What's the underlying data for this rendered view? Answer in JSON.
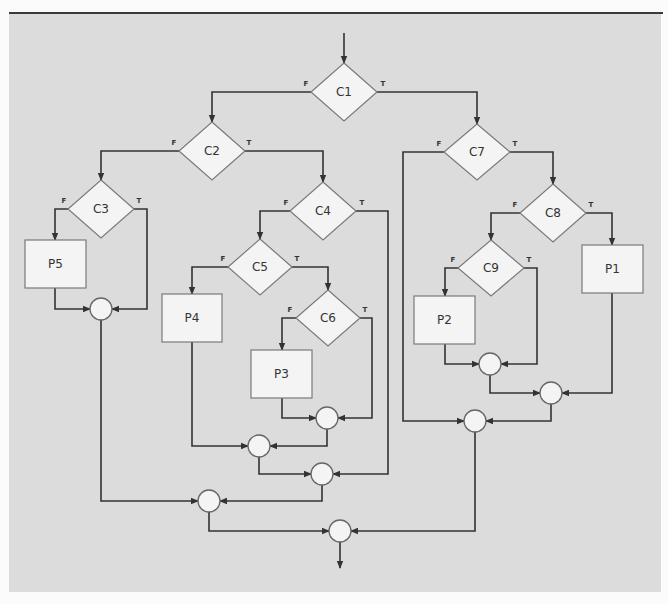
{
  "diagram": {
    "title": "",
    "type": "flowchart",
    "colors": {
      "background": "#dcdcdc",
      "node_fill": "#f4f4f4",
      "node_stroke": "#7a7a7a",
      "edge": "#333333"
    },
    "decisions": [
      {
        "id": "C1",
        "label": "C1",
        "cx": 344,
        "cy": 92,
        "hw": 33,
        "hh": 29
      },
      {
        "id": "C2",
        "label": "C2",
        "cx": 212,
        "cy": 151,
        "hw": 33,
        "hh": 29
      },
      {
        "id": "C3",
        "label": "C3",
        "cx": 101,
        "cy": 209,
        "hw": 33,
        "hh": 29
      },
      {
        "id": "C4",
        "label": "C4",
        "cx": 323,
        "cy": 211,
        "hw": 33,
        "hh": 29
      },
      {
        "id": "C5",
        "label": "C5",
        "cx": 260,
        "cy": 267,
        "hw": 32,
        "hh": 28
      },
      {
        "id": "C6",
        "label": "C6",
        "cx": 328,
        "cy": 318,
        "hw": 32,
        "hh": 28
      },
      {
        "id": "C7",
        "label": "C7",
        "cx": 477,
        "cy": 152,
        "hw": 33,
        "hh": 28
      },
      {
        "id": "C8",
        "label": "C8",
        "cx": 553,
        "cy": 213,
        "hw": 33,
        "hh": 29
      },
      {
        "id": "C9",
        "label": "C9",
        "cx": 491,
        "cy": 268,
        "hw": 33,
        "hh": 28
      }
    ],
    "processes": [
      {
        "id": "P1",
        "label": "P1",
        "x": 582,
        "y": 245,
        "w": 61,
        "h": 48
      },
      {
        "id": "P2",
        "label": "P2",
        "x": 414,
        "y": 296,
        "w": 61,
        "h": 48
      },
      {
        "id": "P3",
        "label": "P3",
        "x": 251,
        "y": 350,
        "w": 61,
        "h": 48
      },
      {
        "id": "P4",
        "label": "P4",
        "x": 162,
        "y": 294,
        "w": 60,
        "h": 48
      },
      {
        "id": "P5",
        "label": "P5",
        "x": 25,
        "y": 240,
        "w": 61,
        "h": 48
      }
    ],
    "junctions": [
      {
        "id": "J1",
        "cx": 101,
        "cy": 309,
        "r": 11
      },
      {
        "id": "J2",
        "cx": 327,
        "cy": 418,
        "r": 11
      },
      {
        "id": "J3",
        "cx": 259,
        "cy": 446,
        "r": 11
      },
      {
        "id": "J4",
        "cx": 322,
        "cy": 474,
        "r": 11
      },
      {
        "id": "J5",
        "cx": 209,
        "cy": 501,
        "r": 11
      },
      {
        "id": "J6",
        "cx": 490,
        "cy": 364,
        "r": 11
      },
      {
        "id": "J7",
        "cx": 551,
        "cy": 393,
        "r": 11
      },
      {
        "id": "J8",
        "cx": 475,
        "cy": 421,
        "r": 11
      },
      {
        "id": "J9",
        "cx": 340,
        "cy": 531,
        "r": 11
      }
    ],
    "branch_labels": [
      {
        "text": "F",
        "x": 306,
        "y": 86
      },
      {
        "text": "T",
        "x": 383,
        "y": 86
      },
      {
        "text": "F",
        "x": 174,
        "y": 145
      },
      {
        "text": "T",
        "x": 249,
        "y": 145
      },
      {
        "text": "F",
        "x": 64,
        "y": 203
      },
      {
        "text": "T",
        "x": 139,
        "y": 203
      },
      {
        "text": "F",
        "x": 286,
        "y": 205
      },
      {
        "text": "T",
        "x": 362,
        "y": 205
      },
      {
        "text": "F",
        "x": 223,
        "y": 261
      },
      {
        "text": "T",
        "x": 297,
        "y": 261
      },
      {
        "text": "F",
        "x": 290,
        "y": 312
      },
      {
        "text": "T",
        "x": 365,
        "y": 312
      },
      {
        "text": "F",
        "x": 439,
        "y": 146
      },
      {
        "text": "T",
        "x": 515,
        "y": 146
      },
      {
        "text": "F",
        "x": 515,
        "y": 207
      },
      {
        "text": "T",
        "x": 591,
        "y": 207
      },
      {
        "text": "F",
        "x": 453,
        "y": 262
      },
      {
        "text": "T",
        "x": 529,
        "y": 262
      }
    ],
    "edges": [
      {
        "from": "start",
        "to": "C1",
        "points": [
          [
            344,
            33
          ],
          [
            344,
            63
          ]
        ],
        "arrow": true
      },
      {
        "from": "C1",
        "to": "C2",
        "branch": "F",
        "points": [
          [
            311,
            92
          ],
          [
            212,
            92
          ],
          [
            212,
            122
          ]
        ],
        "arrow": true
      },
      {
        "from": "C1",
        "to": "C7",
        "branch": "T",
        "points": [
          [
            377,
            92
          ],
          [
            477,
            92
          ],
          [
            477,
            124
          ]
        ],
        "arrow": true
      },
      {
        "from": "C2",
        "to": "C3",
        "branch": "F",
        "points": [
          [
            179,
            151
          ],
          [
            101,
            151
          ],
          [
            101,
            180
          ]
        ],
        "arrow": true
      },
      {
        "from": "C2",
        "to": "C4",
        "branch": "T",
        "points": [
          [
            245,
            151
          ],
          [
            323,
            151
          ],
          [
            323,
            182
          ]
        ],
        "arrow": true
      },
      {
        "from": "C3",
        "to": "P5",
        "branch": "F",
        "points": [
          [
            68,
            209
          ],
          [
            55,
            209
          ],
          [
            55,
            240
          ]
        ],
        "arrow": true
      },
      {
        "from": "C3",
        "to": "J1",
        "branch": "T",
        "points": [
          [
            134,
            209
          ],
          [
            147,
            209
          ],
          [
            147,
            309
          ],
          [
            112,
            309
          ]
        ],
        "arrow": true
      },
      {
        "from": "P5",
        "to": "J1",
        "points": [
          [
            55,
            288
          ],
          [
            55,
            309
          ],
          [
            90,
            309
          ]
        ],
        "arrow": true
      },
      {
        "from": "C4",
        "to": "C5",
        "branch": "F",
        "points": [
          [
            290,
            211
          ],
          [
            260,
            211
          ],
          [
            260,
            239
          ]
        ],
        "arrow": true
      },
      {
        "from": "C4",
        "to": "J4",
        "branch": "T",
        "points": [
          [
            356,
            211
          ],
          [
            388,
            211
          ],
          [
            388,
            474
          ],
          [
            333,
            474
          ]
        ],
        "arrow": true
      },
      {
        "from": "C5",
        "to": "P4",
        "branch": "F",
        "points": [
          [
            228,
            267
          ],
          [
            192,
            267
          ],
          [
            192,
            294
          ]
        ],
        "arrow": true
      },
      {
        "from": "C5",
        "to": "C6",
        "branch": "T",
        "points": [
          [
            292,
            267
          ],
          [
            328,
            267
          ],
          [
            328,
            290
          ]
        ],
        "arrow": true
      },
      {
        "from": "C6",
        "to": "P3",
        "branch": "F",
        "points": [
          [
            296,
            318
          ],
          [
            282,
            318
          ],
          [
            282,
            350
          ]
        ],
        "arrow": true
      },
      {
        "from": "C6",
        "to": "J2",
        "branch": "T",
        "points": [
          [
            360,
            318
          ],
          [
            372,
            318
          ],
          [
            372,
            418
          ],
          [
            338,
            418
          ]
        ],
        "arrow": true
      },
      {
        "from": "P3",
        "to": "J2",
        "points": [
          [
            282,
            398
          ],
          [
            282,
            418
          ],
          [
            316,
            418
          ]
        ],
        "arrow": true
      },
      {
        "from": "P4",
        "to": "J3",
        "points": [
          [
            192,
            342
          ],
          [
            192,
            446
          ],
          [
            248,
            446
          ]
        ],
        "arrow": true
      },
      {
        "from": "J2",
        "to": "J3",
        "points": [
          [
            327,
            429
          ],
          [
            327,
            446
          ],
          [
            270,
            446
          ]
        ],
        "arrow": true
      },
      {
        "from": "J3",
        "to": "J4",
        "points": [
          [
            259,
            457
          ],
          [
            259,
            474
          ],
          [
            311,
            474
          ]
        ],
        "arrow": true
      },
      {
        "from": "J1",
        "to": "J5",
        "points": [
          [
            101,
            320
          ],
          [
            101,
            501
          ],
          [
            198,
            501
          ]
        ],
        "arrow": true
      },
      {
        "from": "J4",
        "to": "J5",
        "points": [
          [
            322,
            485
          ],
          [
            322,
            501
          ],
          [
            220,
            501
          ]
        ],
        "arrow": true
      },
      {
        "from": "J5",
        "to": "J9",
        "points": [
          [
            209,
            512
          ],
          [
            209,
            531
          ],
          [
            329,
            531
          ]
        ],
        "arrow": true
      },
      {
        "from": "C7",
        "to": "J8",
        "branch": "F",
        "points": [
          [
            444,
            152
          ],
          [
            403,
            152
          ],
          [
            403,
            421
          ],
          [
            464,
            421
          ]
        ],
        "arrow": true
      },
      {
        "from": "C7",
        "to": "C8",
        "branch": "T",
        "points": [
          [
            510,
            152
          ],
          [
            553,
            152
          ],
          [
            553,
            184
          ]
        ],
        "arrow": true
      },
      {
        "from": "C8",
        "to": "C9",
        "branch": "F",
        "points": [
          [
            520,
            213
          ],
          [
            491,
            213
          ],
          [
            491,
            240
          ]
        ],
        "arrow": true
      },
      {
        "from": "C8",
        "to": "P1",
        "branch": "T",
        "points": [
          [
            586,
            213
          ],
          [
            612,
            213
          ],
          [
            612,
            245
          ]
        ],
        "arrow": true
      },
      {
        "from": "C9",
        "to": "P2",
        "branch": "F",
        "points": [
          [
            458,
            268
          ],
          [
            445,
            268
          ],
          [
            445,
            296
          ]
        ],
        "arrow": true
      },
      {
        "from": "C9",
        "to": "J6",
        "branch": "T",
        "points": [
          [
            524,
            268
          ],
          [
            537,
            268
          ],
          [
            537,
            364
          ],
          [
            501,
            364
          ]
        ],
        "arrow": true
      },
      {
        "from": "P2",
        "to": "J6",
        "points": [
          [
            445,
            344
          ],
          [
            445,
            364
          ],
          [
            479,
            364
          ]
        ],
        "arrow": true
      },
      {
        "from": "J6",
        "to": "J7",
        "points": [
          [
            490,
            375
          ],
          [
            490,
            393
          ],
          [
            540,
            393
          ]
        ],
        "arrow": true
      },
      {
        "from": "P1",
        "to": "J7",
        "points": [
          [
            612,
            293
          ],
          [
            612,
            393
          ],
          [
            562,
            393
          ]
        ],
        "arrow": true
      },
      {
        "from": "J7",
        "to": "J8",
        "points": [
          [
            551,
            404
          ],
          [
            551,
            421
          ],
          [
            486,
            421
          ]
        ],
        "arrow": true
      },
      {
        "from": "J8",
        "to": "J9",
        "points": [
          [
            475,
            432
          ],
          [
            475,
            531
          ],
          [
            351,
            531
          ]
        ],
        "arrow": true
      },
      {
        "from": "J9",
        "to": "end",
        "points": [
          [
            340,
            542
          ],
          [
            340,
            568
          ]
        ],
        "arrow": true
      }
    ]
  }
}
